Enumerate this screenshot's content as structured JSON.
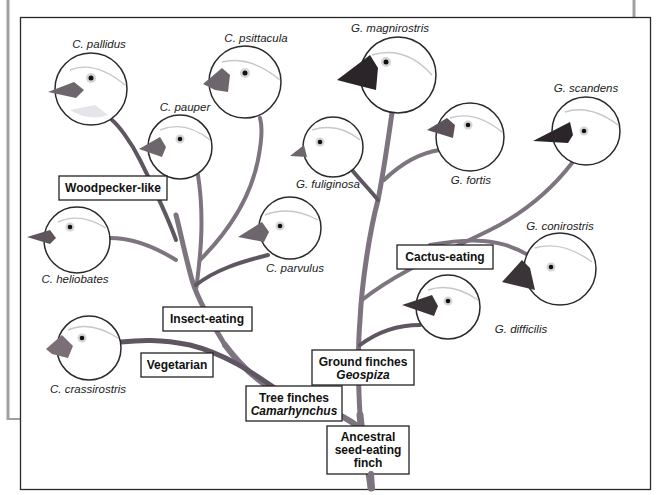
{
  "figure": {
    "frame_color": "#2a2a2a",
    "outer_frame_color": "#9a9a9a",
    "branch_color": "#7d7480",
    "beak_colors": {
      "light": "#7a7078",
      "dark": "#2b2529"
    }
  },
  "category_boxes": {
    "woodpecker_like": "Woodpecker-like",
    "insect_eating": "Insect-eating",
    "vegetarian": "Vegetarian",
    "cactus_eating": "Cactus-eating",
    "tree_finches": {
      "line1": "Tree finches",
      "line2": "Camarhynchus"
    },
    "ground_finches": {
      "line1": "Ground finches",
      "line2": "Geospiza"
    },
    "ancestral": {
      "line1": "Ancestral",
      "line2": "seed-eating",
      "line3": "finch"
    }
  },
  "species": {
    "c_pallidus": "C. pallidus",
    "c_psittacula": "C. psittacula",
    "c_pauper": "C. pauper",
    "c_heliobates": "C. heliobates",
    "c_parvulus": "C. parvulus",
    "c_crassirostris": "C. crassirostris",
    "g_magnirostris": "G. magnirostris",
    "g_fuliginosa": "G. fuliginosa",
    "g_fortis": "G. fortis",
    "g_scandens": "G. scandens",
    "g_conirostris": "G. conirostris",
    "g_difficilis": "G. difficilis"
  }
}
